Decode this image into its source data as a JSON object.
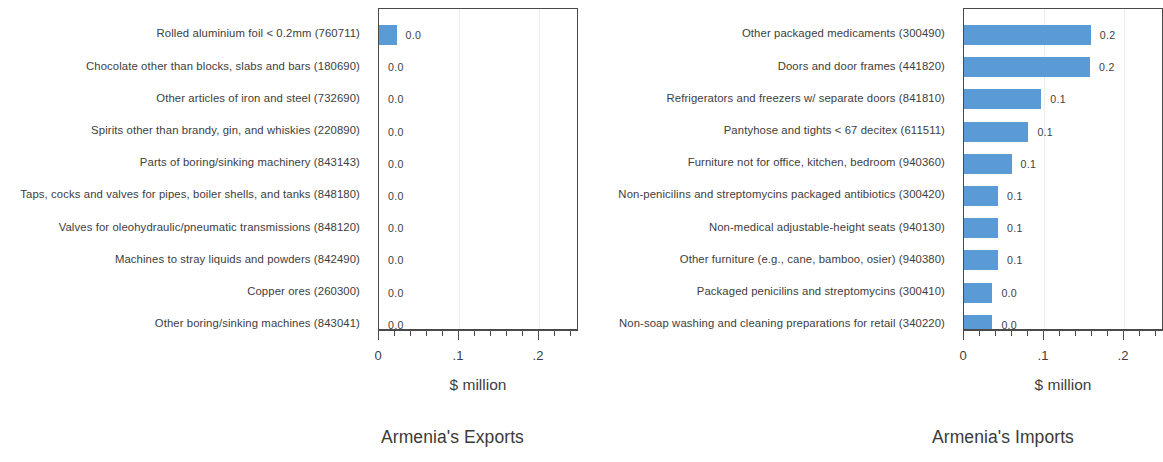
{
  "chart_data": [
    {
      "type": "bar",
      "orientation": "horizontal",
      "title": "Armenia's Exports",
      "xlabel": "$ million",
      "ylabel": "",
      "xlim": [
        0,
        0.25
      ],
      "grid": true,
      "gridlines": [
        0.1,
        0.2
      ],
      "tick_labels": [
        "0",
        ".1",
        ".2"
      ],
      "tick_values": [
        0,
        0.1,
        0.2
      ],
      "minor_tick_step": 0.02,
      "bar_color": "#5b9bd5",
      "categories": [
        "Rolled aluminium foil < 0.2mm (760711)",
        "Chocolate other than blocks, slabs and bars (180690)",
        "Other articles of iron and steel (732690)",
        "Spirits other than brandy, gin, and whiskies (220890)",
        "Parts of boring/sinking machinery (843143)",
        "Taps, cocks and valves for pipes, boiler shells, and tanks (848180)",
        "Valves for oleohydraulic/pneumatic transmissions (848120)",
        "Machines to stray liquids and powders (842490)",
        "Copper ores (260300)",
        "Other boring/sinking machines (843041)"
      ],
      "values": [
        0.022,
        0.0,
        0.0,
        0.0,
        0.0,
        0.0,
        0.0,
        0.0,
        0.0,
        0.0
      ],
      "value_labels": [
        "0.0",
        "0.0",
        "0.0",
        "0.0",
        "0.0",
        "0.0",
        "0.0",
        "0.0",
        "0.0",
        "0.0"
      ]
    },
    {
      "type": "bar",
      "orientation": "horizontal",
      "title": "Armenia's Imports",
      "xlabel": "$ million",
      "ylabel": "",
      "xlim": [
        0,
        0.25
      ],
      "grid": true,
      "gridlines": [
        0.1,
        0.2
      ],
      "tick_labels": [
        "0",
        ".1",
        ".2"
      ],
      "tick_values": [
        0,
        0.1,
        0.2
      ],
      "minor_tick_step": 0.02,
      "bar_color": "#5b9bd5",
      "categories": [
        "Other packaged medicaments (300490)",
        "Doors and door frames (441820)",
        "Refrigerators and freezers w/ separate doors (841810)",
        "Pantyhose and tights < 67 decitex (611511)",
        "Furniture not for office, kitchen, bedroom (940360)",
        "Non-penicilins and streptomycins packaged antibiotics (300420)",
        "Non-medical adjustable-height seats (940130)",
        "Other furniture (e.g., cane, bamboo, osier) (940380)",
        "Packaged penicilins and streptomycins (300410)",
        "Non-soap washing and cleaning preparations for retail (340220)"
      ],
      "values": [
        0.1585,
        0.1575,
        0.0965,
        0.0805,
        0.0595,
        0.0425,
        0.0425,
        0.0425,
        0.0355,
        0.0355
      ],
      "value_labels": [
        "0.2",
        "0.2",
        "0.1",
        "0.1",
        "0.1",
        "0.1",
        "0.1",
        "0.1",
        "0.0",
        "0.0"
      ]
    }
  ]
}
